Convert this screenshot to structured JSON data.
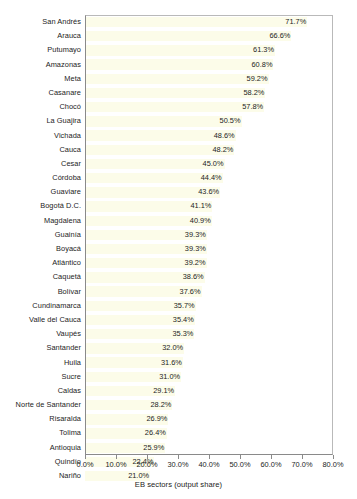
{
  "chart_data": {
    "type": "bar",
    "orientation": "horizontal",
    "title": "",
    "subtitle": "",
    "xlabel": "EB sectors (output share)",
    "ylabel": "",
    "xlim": [
      0,
      80
    ],
    "xtick_labels": [
      "0.0%",
      "10.0%",
      "20.0%",
      "30.0%",
      "40.0%",
      "50.0%",
      "60.0%",
      "70.0%",
      "80.0%"
    ],
    "xtick_values": [
      0,
      10,
      20,
      30,
      40,
      50,
      60,
      70,
      80
    ],
    "grid": false,
    "legend": null,
    "bar_color": "#FCFCE9",
    "value_label_suffix": "%",
    "categories": [
      "San Andrés",
      "Arauca",
      "Putumayo",
      "Amazonas",
      "Meta",
      "Casanare",
      "Chocó",
      "La Guajira",
      "Vichada",
      "Cauca",
      "Cesar",
      "Córdoba",
      "Guaviare",
      "Bogotá D.C.",
      "Magdalena",
      "Guainía",
      "Boyacá",
      "Atlántico",
      "Caquetá",
      "Bolívar",
      "Cundinamarca",
      "Valle del Cauca",
      "Vaupés",
      "Santander",
      "Huila",
      "Sucre",
      "Caldas",
      "Norte de Santander",
      "Risaralda",
      "Tolima",
      "Antioquia",
      "Quindío",
      "Nariño"
    ],
    "values": [
      71.7,
      66.6,
      61.3,
      60.8,
      59.2,
      58.2,
      57.8,
      50.5,
      48.6,
      48.2,
      45.0,
      44.4,
      43.6,
      41.1,
      40.9,
      39.3,
      39.3,
      39.2,
      38.6,
      37.6,
      35.7,
      35.4,
      35.3,
      32.0,
      31.6,
      31.0,
      29.1,
      28.2,
      26.9,
      26.4,
      25.9,
      22.4,
      21.0
    ],
    "value_labels": [
      "71.7%",
      "66.6%",
      "61.3%",
      "60.8%",
      "59.2%",
      "58.2%",
      "57.8%",
      "50.5%",
      "48.6%",
      "48.2%",
      "45.0%",
      "44.4%",
      "43.6%",
      "41.1%",
      "40.9%",
      "39.3%",
      "39.3%",
      "39.2%",
      "38.6%",
      "37.6%",
      "35.7%",
      "35.4%",
      "35.3%",
      "32.0%",
      "31.6%",
      "31.0%",
      "29.1%",
      "28.2%",
      "26.9%",
      "26.4%",
      "25.9%",
      "22.4%",
      "21.0%"
    ]
  }
}
